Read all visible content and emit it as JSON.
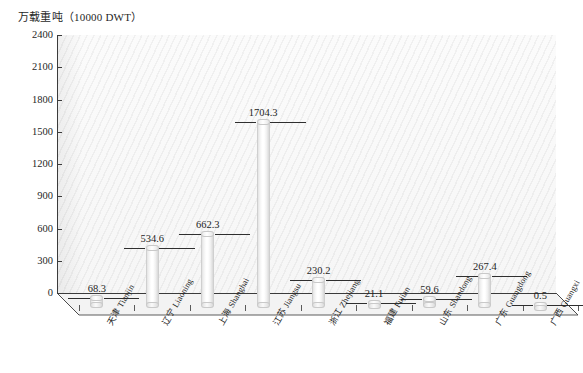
{
  "chart_data": {
    "type": "bar",
    "title": "万载重吨（10000 DWT）",
    "xlabel": "",
    "ylabel": "万载重吨（10000 DWT）",
    "ylim": [
      0,
      2400
    ],
    "yticks": [
      0,
      300,
      600,
      900,
      1200,
      1500,
      1800,
      2100,
      2400
    ],
    "grid": false,
    "legend": "none",
    "categories": [
      "天津 Tianjin",
      "辽宁 Liaoning",
      "上海 Shanghai",
      "江苏 Jiangsu",
      "浙江 Zhejiang",
      "福建 Fujian",
      "山东 Shandong",
      "广东 Guangdong",
      "广西 Guangxi"
    ],
    "values": [
      68.3,
      534.6,
      662.3,
      1704.3,
      230.2,
      21.1,
      59.6,
      267.4,
      0.5
    ],
    "value_labels": [
      "68.3",
      "534.6",
      "662.3",
      "1704.3",
      "230.2",
      "21.1",
      "59.6",
      "267.4",
      "0.5"
    ]
  },
  "style": {
    "axis_color": "#3b3b3b",
    "text_color": "#1f1f1f",
    "bar_face": "#ffffff",
    "bar_edge": "#cfcfcf",
    "wall_fill": "#f7f7f7",
    "floor_fill": "#f2f2f2"
  }
}
